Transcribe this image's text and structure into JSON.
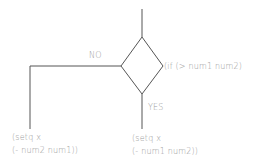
{
  "diagram": {
    "type": "flowchart",
    "decision": {
      "label": "(if (> num1 num2)",
      "shape": "diamond"
    },
    "branches": {
      "no": {
        "label": "NO",
        "action_line1": "(setq x",
        "action_line2": "(- num2 num1))"
      },
      "yes": {
        "label": "YES",
        "action_line1": "(setq x",
        "action_line2": "(- num1 num2))"
      }
    },
    "colors": {
      "line": "#555555",
      "text": "#9a9a9a",
      "background": "#ffffff"
    }
  }
}
